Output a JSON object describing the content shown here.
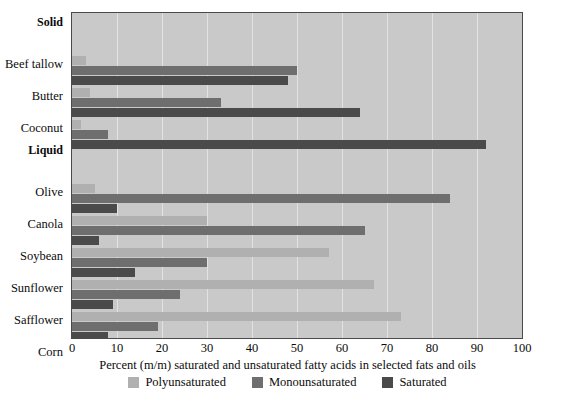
{
  "chart_data": {
    "type": "bar",
    "orientation": "horizontal",
    "title": "",
    "xlabel": "Percent (m/m) saturated and unsaturated fatty acids in selected fats and oils",
    "ylabel": "",
    "xlim": [
      0,
      100
    ],
    "xticks": [
      0,
      10,
      20,
      30,
      40,
      50,
      60,
      70,
      80,
      90,
      100
    ],
    "grid": true,
    "legend_position": "bottom",
    "group_headers": [
      "Solid",
      "Liquid"
    ],
    "categories": [
      "Beef tallow",
      "Butter",
      "Coconut",
      "Olive",
      "Canola",
      "Soybean",
      "Sunflower",
      "Safflower",
      "Corn"
    ],
    "series": [
      {
        "name": "Polyunsaturated",
        "color": "#b0b0b0",
        "values": [
          3,
          4,
          2,
          5,
          30,
          57,
          67,
          73,
          34
        ]
      },
      {
        "name": "Monounsaturated",
        "color": "#6e6e6e",
        "values": [
          50,
          33,
          8,
          84,
          65,
          30,
          24,
          19,
          51
        ]
      },
      {
        "name": "Saturated",
        "color": "#4a4a4a",
        "values": [
          48,
          64,
          92,
          10,
          6,
          14,
          9,
          8,
          15
        ]
      }
    ],
    "rows": [
      {
        "kind": "header",
        "label": "Solid"
      },
      {
        "kind": "category",
        "label": "Beef tallow",
        "poly": 3,
        "mono": 50,
        "sat": 48
      },
      {
        "kind": "category",
        "label": "Butter",
        "poly": 4,
        "mono": 33,
        "sat": 64
      },
      {
        "kind": "category",
        "label": "Coconut",
        "poly": 2,
        "mono": 8,
        "sat": 92
      },
      {
        "kind": "header",
        "label": "Liquid"
      },
      {
        "kind": "category",
        "label": "Olive",
        "poly": 5,
        "mono": 84,
        "sat": 10
      },
      {
        "kind": "category",
        "label": "Canola",
        "poly": 30,
        "mono": 65,
        "sat": 6
      },
      {
        "kind": "category",
        "label": "Soybean",
        "poly": 57,
        "mono": 30,
        "sat": 14
      },
      {
        "kind": "category",
        "label": "Sunflower",
        "poly": 67,
        "mono": 24,
        "sat": 9
      },
      {
        "kind": "category",
        "label": "Safflower",
        "poly": 73,
        "mono": 19,
        "sat": 8
      },
      {
        "kind": "category",
        "label": "Corn",
        "poly": 34,
        "mono": 51,
        "sat": 15
      }
    ],
    "legend": [
      {
        "label": "Polyunsaturated",
        "color": "#b0b0b0",
        "key": "poly"
      },
      {
        "label": "Monounsaturated",
        "color": "#6e6e6e",
        "key": "mono"
      },
      {
        "label": "Saturated",
        "color": "#4a4a4a",
        "key": "sat"
      }
    ]
  },
  "style": {
    "plot_background": "#c9c9c9",
    "grid_color": "#e2e2e2",
    "axis_color": "#4a4a4a",
    "text_color": "#0b0b0b"
  }
}
